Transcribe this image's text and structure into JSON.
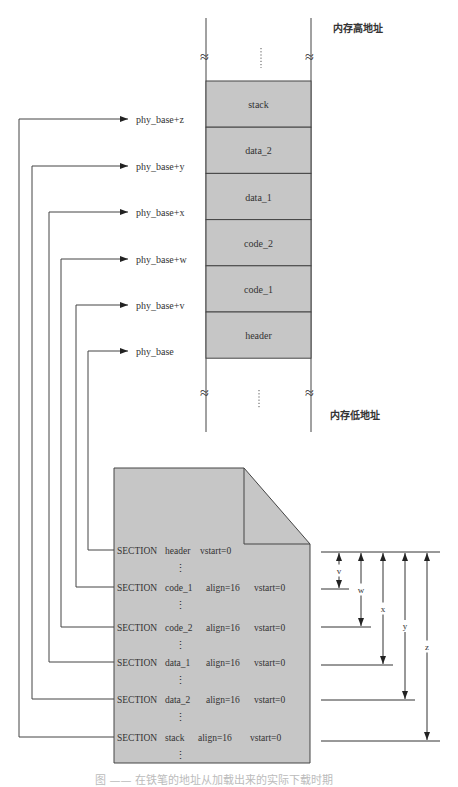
{
  "memory": {
    "high_label": "内存高地址",
    "low_label": "内存低地址",
    "ellipsis": "⋮",
    "break_mark": "≈",
    "fill_color": "#c6c6c6",
    "blocks": [
      {
        "label": "stack"
      },
      {
        "label": "data_2"
      },
      {
        "label": "data_1"
      },
      {
        "label": "code_2"
      },
      {
        "label": "code_1"
      },
      {
        "label": "header"
      }
    ]
  },
  "addresses": [
    {
      "label": "phy_base+z"
    },
    {
      "label": "phy_base+y"
    },
    {
      "label": "phy_base+x"
    },
    {
      "label": "phy_base+w"
    },
    {
      "label": "phy_base+v"
    },
    {
      "label": "phy_base"
    }
  ],
  "source_file": {
    "fill_color": "#c6c6c6",
    "vertical_ellipsis": "⋮",
    "sections": [
      {
        "keyword": "SECTION",
        "name": "header",
        "align": "",
        "vstart": "vstart=0"
      },
      {
        "keyword": "SECTION",
        "name": "code_1",
        "align": "align=16",
        "vstart": "vstart=0"
      },
      {
        "keyword": "SECTION",
        "name": "code_2",
        "align": "align=16",
        "vstart": "vstart=0"
      },
      {
        "keyword": "SECTION",
        "name": "data_1",
        "align": "align=16",
        "vstart": "vstart=0"
      },
      {
        "keyword": "SECTION",
        "name": "data_2",
        "align": "align=16",
        "vstart": "vstart=0"
      },
      {
        "keyword": "SECTION",
        "name": "stack",
        "align": "align=16",
        "vstart": "vstart=0"
      }
    ]
  },
  "offsets": [
    {
      "label": "v"
    },
    {
      "label": "w"
    },
    {
      "label": "x"
    },
    {
      "label": "y"
    },
    {
      "label": "z"
    }
  ],
  "caption": "图 —— 在铁笔的地址从加载出来的实际下载时期"
}
